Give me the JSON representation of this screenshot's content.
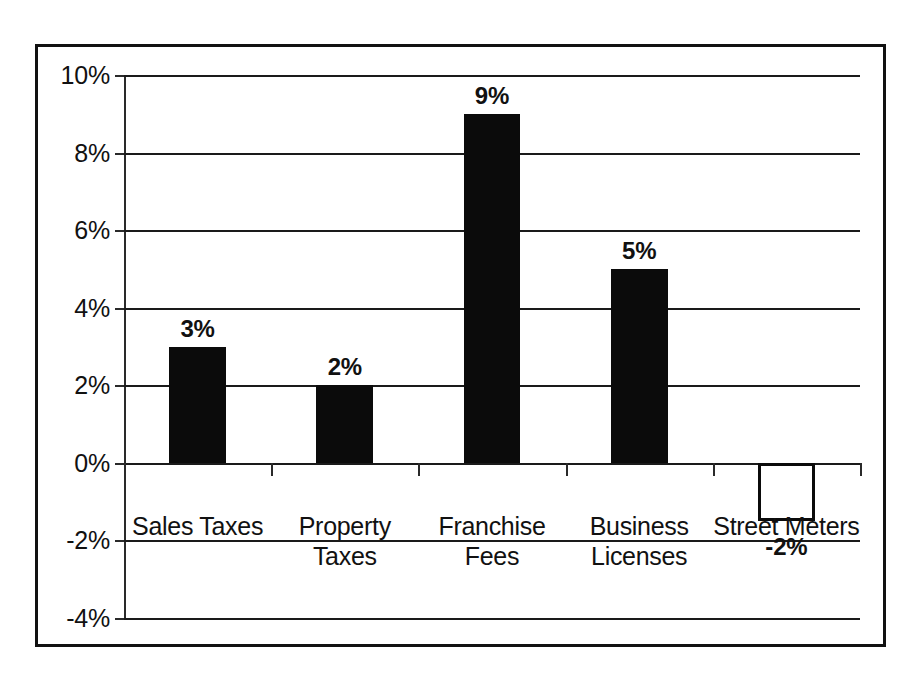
{
  "chart_data": {
    "type": "bar",
    "title": "",
    "subtitle": "",
    "xlabel": "",
    "ylabel": "",
    "categories": [
      "Sales Taxes",
      "Property Taxes",
      "Franchise Fees",
      "Business Licenses",
      "Street Meters"
    ],
    "category_lines": [
      [
        "Sales Taxes"
      ],
      [
        "Property",
        "Taxes"
      ],
      [
        "Franchise",
        "Fees"
      ],
      [
        "Business",
        "Licenses"
      ],
      [
        "Street Meters"
      ]
    ],
    "values": [
      3,
      2,
      9,
      5,
      -2
    ],
    "data_labels": [
      "3%",
      "2%",
      "9%",
      "5%",
      "-2%"
    ],
    "bar_fill": [
      "#0b0b0b",
      "#0b0b0b",
      "#0b0b0b",
      "#0b0b0b",
      "#ffffff"
    ],
    "bar_stroke": [
      "#0b0b0b",
      "#0b0b0b",
      "#0b0b0b",
      "#0b0b0b",
      "#0b0b0b"
    ],
    "drawn_values": [
      3,
      2,
      9,
      5,
      -1.5
    ],
    "ylim": [
      -4,
      10
    ],
    "ytick_values": [
      10,
      8,
      6,
      4,
      2,
      0,
      -2,
      -4
    ],
    "ytick_labels": [
      "10%",
      "8%",
      "6%",
      "4%",
      "2%",
      "0%",
      "-2%",
      "-4%"
    ],
    "grid": true,
    "grid_axis": "y",
    "legend": false,
    "legend_position": "none",
    "series": [
      {
        "name": "Percent Change",
        "values": [
          3,
          2,
          9,
          5,
          -2
        ]
      }
    ],
    "units": "percent",
    "colors": {
      "axis": "#1a1a1a",
      "grid": "#1a1a1a",
      "bar": "#0b0b0b",
      "text": "#111111",
      "background": "#ffffff",
      "frame": "#111111"
    }
  }
}
